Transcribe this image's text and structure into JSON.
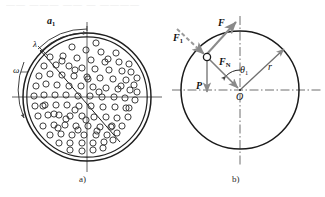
{
  "figure": {
    "top_partial_text": "—— ——— —— — ————",
    "captions": {
      "a": "a)",
      "b": "b)"
    },
    "colors": {
      "ink": "#1a1a1a",
      "line": "#222222",
      "gray_vector": "#8a8a8a",
      "ball_outline": "#333333",
      "background": "#ffffff"
    }
  },
  "panel_a": {
    "name": "mill-drum-cross-section",
    "labels": {
      "a1": "a",
      "a1_sub": "1",
      "lambda": "λ",
      "omega": "ω"
    },
    "geometry": {
      "center_x": 87,
      "center_y": 97,
      "outer_radius": 64,
      "inner_radius": 60,
      "ball_radius": 3.1,
      "ball_count": 120
    },
    "balls": [
      [
        66,
        41
      ],
      [
        80,
        38
      ],
      [
        96,
        43
      ],
      [
        112,
        40
      ],
      [
        124,
        48
      ],
      [
        133,
        58
      ],
      [
        139,
        70
      ],
      [
        58,
        48
      ],
      [
        72,
        47
      ],
      [
        86,
        50
      ],
      [
        101,
        52
      ],
      [
        116,
        53
      ],
      [
        129,
        64
      ],
      [
        137,
        78
      ],
      [
        50,
        57
      ],
      [
        63,
        56
      ],
      [
        77,
        58
      ],
      [
        91,
        60
      ],
      [
        105,
        62
      ],
      [
        119,
        62
      ],
      [
        131,
        72
      ],
      [
        44,
        66
      ],
      [
        56,
        65
      ],
      [
        69,
        66
      ],
      [
        82,
        68
      ],
      [
        95,
        69
      ],
      [
        109,
        70
      ],
      [
        122,
        71
      ],
      [
        134,
        85
      ],
      [
        39,
        76
      ],
      [
        50,
        74
      ],
      [
        62,
        75
      ],
      [
        74,
        76
      ],
      [
        87,
        77
      ],
      [
        100,
        78
      ],
      [
        113,
        79
      ],
      [
        126,
        80
      ],
      [
        137,
        92
      ],
      [
        36,
        86
      ],
      [
        46,
        84
      ],
      [
        57,
        85
      ],
      [
        69,
        86
      ],
      [
        81,
        86
      ],
      [
        93,
        87
      ],
      [
        106,
        88
      ],
      [
        118,
        89
      ],
      [
        130,
        90
      ],
      [
        34,
        96
      ],
      [
        44,
        95
      ],
      [
        55,
        95
      ],
      [
        66,
        95
      ],
      [
        78,
        96
      ],
      [
        90,
        96
      ],
      [
        102,
        97
      ],
      [
        114,
        97
      ],
      [
        125,
        98
      ],
      [
        135,
        100
      ],
      [
        35,
        106
      ],
      [
        45,
        105
      ],
      [
        56,
        105
      ],
      [
        67,
        105
      ],
      [
        79,
        106
      ],
      [
        91,
        106
      ],
      [
        103,
        107
      ],
      [
        115,
        107
      ],
      [
        126,
        108
      ],
      [
        38,
        116
      ],
      [
        48,
        115
      ],
      [
        59,
        115
      ],
      [
        70,
        116
      ],
      [
        82,
        116
      ],
      [
        94,
        117
      ],
      [
        106,
        117
      ],
      [
        117,
        118
      ],
      [
        128,
        117
      ],
      [
        43,
        126
      ],
      [
        54,
        125
      ],
      [
        65,
        125
      ],
      [
        76,
        126
      ],
      [
        88,
        126
      ],
      [
        100,
        127
      ],
      [
        111,
        127
      ],
      [
        122,
        126
      ],
      [
        50,
        135
      ],
      [
        61,
        134
      ],
      [
        72,
        135
      ],
      [
        84,
        135
      ],
      [
        96,
        135
      ],
      [
        107,
        135
      ],
      [
        117,
        133
      ],
      [
        59,
        143
      ],
      [
        70,
        143
      ],
      [
        82,
        143
      ],
      [
        93,
        143
      ],
      [
        104,
        142
      ],
      [
        113,
        140
      ],
      [
        70,
        150
      ],
      [
        82,
        151
      ],
      [
        93,
        150
      ],
      [
        103,
        148
      ],
      [
        84,
        157
      ],
      [
        95,
        155
      ],
      [
        62,
        61
      ],
      [
        75,
        70
      ],
      [
        88,
        79
      ],
      [
        99,
        92
      ],
      [
        75,
        110
      ],
      [
        86,
        120
      ],
      [
        97,
        131
      ],
      [
        66,
        119
      ],
      [
        108,
        59
      ],
      [
        121,
        86
      ],
      [
        129,
        108
      ],
      [
        54,
        114
      ],
      [
        43,
        106
      ],
      [
        112,
        126
      ],
      [
        58,
        128
      ],
      [
        78,
        130
      ]
    ]
  },
  "panel_b": {
    "name": "force-analysis-diagram",
    "labels": {
      "F1": "F",
      "F1_sub": "1",
      "F": "F",
      "FN": "F",
      "FN_sub": "N",
      "theta1": "θ",
      "theta1_sub": "1",
      "r": "r",
      "P": "P",
      "O": "O"
    },
    "geometry": {
      "center_x": 240,
      "center_y": 90,
      "radius": 59,
      "ball_x": 207,
      "ball_y": 57,
      "ball_radius": 3.6,
      "theta1_degrees": 45
    },
    "vectors": [
      {
        "name": "F1",
        "style": "dashed",
        "from": [
          178,
          30
        ],
        "to": [
          205,
          55
        ],
        "color": "#8f8f8f"
      },
      {
        "name": "F",
        "style": "solid",
        "from": [
          206,
          54
        ],
        "to": [
          235,
          22
        ],
        "color": "#7d7d7d"
      },
      {
        "name": "FN",
        "style": "solid",
        "from": [
          207,
          58
        ],
        "to": [
          240,
          90
        ],
        "color": "#7d7d7d"
      },
      {
        "name": "P",
        "style": "solid",
        "from": [
          207,
          58
        ],
        "to": [
          207,
          92
        ],
        "color": "#8a8a8a"
      },
      {
        "name": "r",
        "style": "solid",
        "from": [
          240,
          90
        ],
        "to": [
          284,
          48
        ],
        "color": "#6f6f6f"
      }
    ]
  }
}
